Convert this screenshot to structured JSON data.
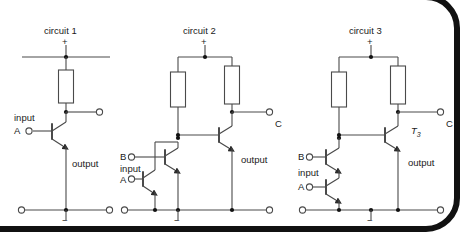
{
  "figure": {
    "kind": "schematic-diagram",
    "circuits": [
      {
        "id": "circuit-1",
        "title": "circuit 1",
        "supply_label": "+",
        "ground_label": "−",
        "labels": {
          "input": "input",
          "input_a": "A",
          "output": "output"
        },
        "resistors": 1,
        "transistors": 1
      },
      {
        "id": "circuit-2",
        "title": "circuit 2",
        "supply_label": "+",
        "ground_label": "−",
        "labels": {
          "input_b": "B",
          "input": "input",
          "input_a": "A",
          "output": "output",
          "terminal_c": "C"
        },
        "resistors": 2,
        "transistors": 3
      },
      {
        "id": "circuit-3",
        "title": "circuit 3",
        "supply_label": "+",
        "ground_label": "−",
        "labels": {
          "input_b": "B",
          "input": "input",
          "input_a": "A",
          "output": "output",
          "terminal_c": "C",
          "transistor_3_name": "T",
          "transistor_3_sub": "3"
        },
        "resistors": 2,
        "transistors": 3
      }
    ]
  },
  "colors": {
    "wire": "#4a4a4a",
    "node": "#111111",
    "text": "#1a1a1a",
    "frame": "#111111",
    "page": "#ffffff",
    "corner_dot": "#3f3f3f"
  }
}
